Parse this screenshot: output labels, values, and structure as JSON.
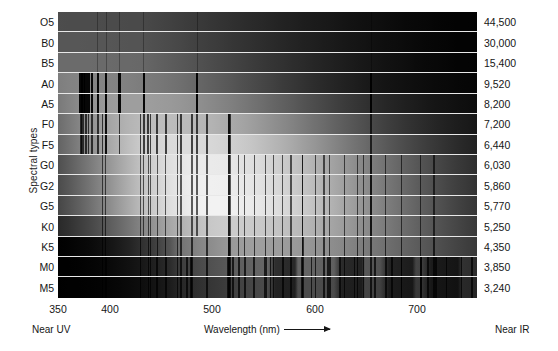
{
  "chart_data": {
    "type": "heatmap",
    "xlabel": "Wavelength (nm)",
    "ylabel": "Spectral types",
    "y2label": "Surface temperature (K)",
    "xlim": [
      350,
      760
    ],
    "xticks": [
      350,
      400,
      500,
      600,
      700
    ],
    "xtick_labels": [
      "350",
      "400",
      "500",
      "600",
      "700"
    ],
    "x_left_note": "Near UV",
    "x_right_note": "Near IR",
    "grid": false,
    "legend": false,
    "categories": [
      "O5",
      "B0",
      "B5",
      "A0",
      "A5",
      "F0",
      "F5",
      "G0",
      "G2",
      "G5",
      "K0",
      "K5",
      "M0",
      "M5"
    ],
    "series": [
      {
        "name": "Surface temperature (K)",
        "values": [
          44500,
          30000,
          15400,
          9520,
          8200,
          7200,
          6440,
          6030,
          5860,
          5770,
          5250,
          4350,
          3850,
          3240
        ]
      },
      {
        "name": "Continuum peak wavelength (nm)",
        "values": [
          350,
          350,
          355,
          380,
          420,
          450,
          470,
          490,
          495,
          500,
          520,
          545,
          565,
          580
        ]
      },
      {
        "name": "Relative brightness at peak (0-1)",
        "values": [
          0.3,
          0.34,
          0.42,
          0.52,
          0.62,
          0.74,
          0.86,
          0.92,
          0.94,
          0.95,
          0.8,
          0.62,
          0.4,
          0.3
        ]
      }
    ],
    "rows": [
      {
        "type": "O5",
        "temperature": "44,500",
        "temperature_k": 44500,
        "peak_nm": 350,
        "brightness": 0.3
      },
      {
        "type": "B0",
        "temperature": "30,000",
        "temperature_k": 30000,
        "peak_nm": 350,
        "brightness": 0.34
      },
      {
        "type": "B5",
        "temperature": "15,400",
        "temperature_k": 15400,
        "peak_nm": 355,
        "brightness": 0.42
      },
      {
        "type": "A0",
        "temperature": "9,520",
        "temperature_k": 9520,
        "peak_nm": 380,
        "brightness": 0.52
      },
      {
        "type": "A5",
        "temperature": "8,200",
        "temperature_k": 8200,
        "peak_nm": 420,
        "brightness": 0.62
      },
      {
        "type": "F0",
        "temperature": "7,200",
        "temperature_k": 7200,
        "peak_nm": 450,
        "brightness": 0.74
      },
      {
        "type": "F5",
        "temperature": "6,440",
        "temperature_k": 6440,
        "peak_nm": 470,
        "brightness": 0.86
      },
      {
        "type": "G0",
        "temperature": "6,030",
        "temperature_k": 6030,
        "peak_nm": 490,
        "brightness": 0.92
      },
      {
        "type": "G2",
        "temperature": "5,860",
        "temperature_k": 5860,
        "peak_nm": 495,
        "brightness": 0.94
      },
      {
        "type": "G5",
        "temperature": "5,770",
        "temperature_k": 5770,
        "peak_nm": 500,
        "brightness": 0.95
      },
      {
        "type": "K0",
        "temperature": "5,250",
        "temperature_k": 5250,
        "peak_nm": 520,
        "brightness": 0.8
      },
      {
        "type": "K5",
        "temperature": "4,350",
        "temperature_k": 4350,
        "peak_nm": 545,
        "brightness": 0.62
      },
      {
        "type": "M0",
        "temperature": "3,850",
        "temperature_k": 3850,
        "peak_nm": 565,
        "brightness": 0.4
      },
      {
        "type": "M5",
        "temperature": "3,240",
        "temperature_k": 3240,
        "peak_nm": 580,
        "brightness": 0.3
      }
    ]
  },
  "axes": {
    "left_title": "Spectral types",
    "right_title": "Surface temperature (K)",
    "x_title": "Wavelength  (nm)",
    "near_uv": "Near UV",
    "near_ir": "Near IR"
  },
  "colors": {
    "background": "#ffffff",
    "text": "#161616",
    "row_separator": "#e8e8e8",
    "plot_background": "#000000"
  }
}
